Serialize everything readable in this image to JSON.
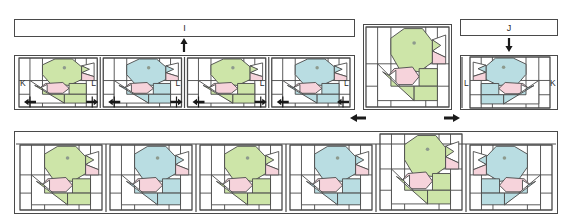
{
  "document": {
    "type": "quilt-assembly-diagram",
    "instruction_text": "ock row should measure 5 4\" x 50 1/2\"."
  },
  "colors": {
    "green": "#cde5a8",
    "blue": "#b9dde2",
    "pink": "#f6d3db",
    "white": "#ffffff",
    "outline": "#4a4a4a",
    "eye": "#8d9a8d",
    "text": "#2a2a2a"
  },
  "strips": [
    {
      "label": "I",
      "arrow": "up",
      "name": "sashing-strip-i"
    },
    {
      "label": "J",
      "arrow": "down",
      "name": "sashing-strip-j"
    }
  ],
  "middle_row": {
    "name": "middle-block-row",
    "blocks": [
      {
        "color": "green",
        "facing": "right",
        "left_label": "K",
        "right_label": "L"
      },
      {
        "color": "blue",
        "facing": "right",
        "left_label": "",
        "right_label": "L"
      },
      {
        "color": "green",
        "facing": "right",
        "left_label": "",
        "right_label": "L"
      },
      {
        "color": "blue",
        "facing": "right",
        "left_label": "",
        "right_label": "L"
      }
    ],
    "seam_arrows": 8
  },
  "right_blocks": [
    {
      "name": "single-green-block",
      "color": "green",
      "facing": "right",
      "left_label": "",
      "right_label": ""
    },
    {
      "name": "mirrored-blue-block",
      "color": "blue",
      "facing": "left",
      "left_label": "L",
      "right_label": "K"
    }
  ],
  "direction_arrows": [
    {
      "name": "arrow-left",
      "direction": "left"
    },
    {
      "name": "arrow-right",
      "direction": "right"
    }
  ],
  "bottom_row": {
    "name": "bottom-block-row",
    "blocks": [
      {
        "color": "green",
        "facing": "right"
      },
      {
        "color": "blue",
        "facing": "right"
      },
      {
        "color": "green",
        "facing": "right"
      },
      {
        "color": "blue",
        "facing": "right"
      },
      {
        "color": "green",
        "facing": "right"
      },
      {
        "color": "blue",
        "facing": "left"
      }
    ]
  }
}
